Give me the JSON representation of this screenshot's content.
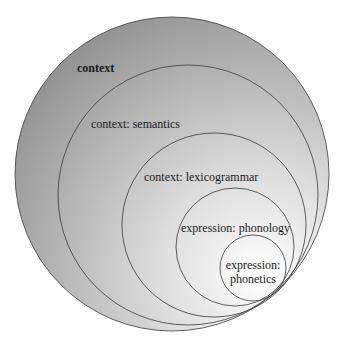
{
  "diagram": {
    "type": "nested-circles",
    "circles": [
      {
        "id": "context",
        "label": "context",
        "bold": true,
        "cx": 172,
        "cy": 174,
        "r": 157
      },
      {
        "id": "semantics",
        "label": "context: semantics",
        "bold": false,
        "cx": 188,
        "cy": 195,
        "r": 130
      },
      {
        "id": "lexicogrammar",
        "label": "context: lexicogrammar",
        "bold": false,
        "cx": 214,
        "cy": 225,
        "r": 92
      },
      {
        "id": "phonology",
        "label": "expression: phonology",
        "bold": false,
        "cx": 235,
        "cy": 247,
        "r": 59
      },
      {
        "id": "phonetics",
        "label_line1": "expression:",
        "label_line2": "phonetics",
        "bold": false,
        "cx": 253,
        "cy": 268,
        "r": 33
      }
    ],
    "colors": {
      "fill_dark": "#9a9a9a",
      "fill_light": "#ffffff",
      "stroke": "#3a3a3a"
    }
  }
}
